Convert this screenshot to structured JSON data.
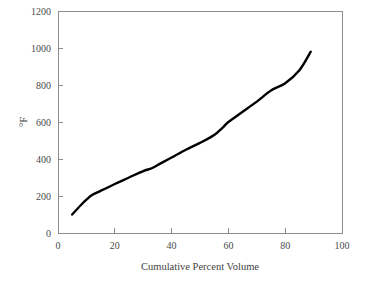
{
  "chart_data": {
    "type": "line",
    "title": "",
    "xlabel": "Cumulative Percent Volume",
    "ylabel": "°F",
    "xlim": [
      0,
      100
    ],
    "ylim": [
      0,
      1200
    ],
    "xticks": [
      0,
      20,
      40,
      60,
      80,
      100
    ],
    "yticks": [
      0,
      200,
      400,
      600,
      800,
      1000,
      1200
    ],
    "xtick_labels": [
      "0",
      "20",
      "40",
      "60",
      "80",
      "100"
    ],
    "ytick_labels": [
      "0",
      "200",
      "400",
      "600",
      "800",
      "1000",
      "1200"
    ],
    "grid": false,
    "legend": null,
    "series": [
      {
        "name": "Distillation curve",
        "color": "#000000",
        "x": [
          5,
          8,
          10,
          12,
          15,
          20,
          25,
          30,
          33,
          36,
          40,
          45,
          50,
          55,
          58,
          60,
          65,
          70,
          75,
          80,
          85,
          89
        ],
        "y": [
          100,
          150,
          180,
          205,
          228,
          265,
          300,
          335,
          350,
          375,
          408,
          450,
          487,
          530,
          570,
          600,
          655,
          710,
          770,
          810,
          880,
          980
        ]
      }
    ]
  },
  "axes": {
    "x_title": "Cumulative Percent Volume",
    "y_title": "°F"
  }
}
